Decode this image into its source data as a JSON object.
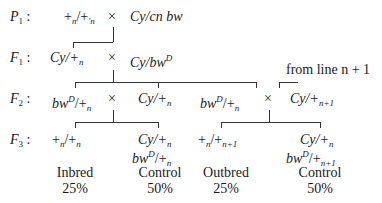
{
  "generations": {
    "P1": {
      "label": "P",
      "sub": "1",
      "left": "+",
      "left_sub": "n",
      "left2": "/+",
      "left2_sub": "′n",
      "cross": "×",
      "right": "Cy/cn bw"
    },
    "F1": {
      "label": "F",
      "sub": "1",
      "left_a": "Cy/+",
      "left_sub": "n",
      "cross": "×",
      "right_a": "Cy/bw",
      "right_sup": "D"
    },
    "F2": {
      "label": "F",
      "sub": "2",
      "cross1": {
        "left_a": "bw",
        "left_sup": "D",
        "left_b": "/+",
        "left_sub": "n",
        "cross": "×",
        "right_a": "Cy/+",
        "right_sub": "n"
      },
      "cross2": {
        "left_a": "bw",
        "left_sup": "D",
        "left_b": "/+",
        "left_sub": "n",
        "cross": "×",
        "right_a": "Cy/+",
        "right_sub": "n+1"
      },
      "annotation": "from line n + 1"
    },
    "F3": {
      "label": "F",
      "sub": "3",
      "outcomes": [
        {
          "line1_a": "+",
          "line1_sub": "n",
          "line1_b": "/+",
          "line1_sub2": "n",
          "line2": "",
          "category": "Inbred",
          "percent": "25%"
        },
        {
          "line1_a": "Cy/+",
          "line1_sub": "n",
          "line2_a": "bw",
          "line2_sup": "D",
          "line2_b": "/+",
          "line2_sub": "n",
          "category": "Control",
          "percent": "50%"
        },
        {
          "line1_a": "+",
          "line1_sub": "n",
          "line1_b": "/+",
          "line1_sub2": "n+1",
          "line2": "",
          "category": "Outbred",
          "percent": "25%"
        },
        {
          "line1_a": "Cy/+",
          "line1_sub": "n",
          "line2_a": "bw",
          "line2_sup": "D",
          "line2_b": "/+",
          "line2_sub": "n+1",
          "category": "Control",
          "percent": "50%"
        }
      ]
    }
  }
}
